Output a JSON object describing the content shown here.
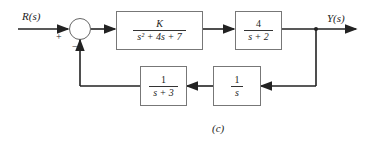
{
  "diagram": {
    "input_label": "R(s)",
    "output_label": "Y(s)",
    "sum_signs": {
      "plus": "+",
      "minus": "−"
    },
    "blocks": [
      {
        "id": "G1",
        "numerator": "K",
        "denominator": "s² + 4s + 7"
      },
      {
        "id": "G2",
        "numerator": "4",
        "denominator": "s + 2"
      },
      {
        "id": "H2",
        "numerator": "1",
        "denominator": "s"
      },
      {
        "id": "H1",
        "numerator": "1",
        "denominator": "s + 3"
      }
    ],
    "caption": "(c)"
  }
}
